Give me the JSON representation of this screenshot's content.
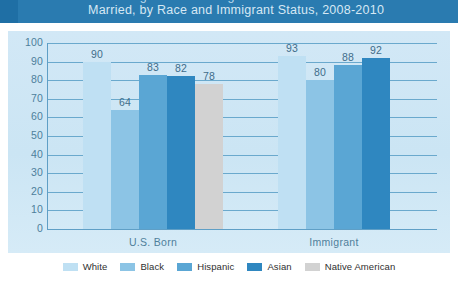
{
  "header": {
    "cut_title_line": "Percentage of Women Ages 18-44 Who Are",
    "subtitle": "Married, by Race and Immigrant Status, 2008-2010",
    "band_color": "#2a7bb0"
  },
  "chart_data": {
    "type": "bar",
    "title": "",
    "subtitle": "Married, by Race and Immigrant Status, 2008-2010",
    "xlabel": "",
    "ylabel": "",
    "ylim": [
      0,
      100
    ],
    "yticks": [
      100,
      90,
      80,
      70,
      60,
      50,
      40,
      30,
      20,
      10,
      0
    ],
    "grid": true,
    "legend_position": "bottom",
    "categories": [
      "U.S. Born",
      "Immigrant"
    ],
    "series": [
      {
        "name": "White",
        "color": "#bfe0f3",
        "values": [
          90,
          93
        ]
      },
      {
        "name": "Black",
        "color": "#8cc4e5",
        "values": [
          64,
          80
        ]
      },
      {
        "name": "Hispanic",
        "color": "#5aa6d4",
        "values": [
          83,
          88
        ]
      },
      {
        "name": "Asian",
        "color": "#2f87c0",
        "values": [
          82,
          92
        ]
      },
      {
        "name": "Native American",
        "color": "#d2d2d2",
        "values": [
          78,
          null
        ]
      }
    ],
    "data_labels": {
      "U.S. Born": [
        "90",
        "64",
        "83",
        "82",
        "78"
      ],
      "Immigrant": [
        "93",
        "80",
        "88",
        "92"
      ]
    }
  },
  "legend": {
    "items": [
      {
        "label": "White",
        "color": "#bfe0f3"
      },
      {
        "label": "Black",
        "color": "#8cc4e5"
      },
      {
        "label": "Hispanic",
        "color": "#5aa6d4"
      },
      {
        "label": "Asian",
        "color": "#2f87c0"
      },
      {
        "label": "Native American",
        "color": "#d2d2d2"
      }
    ]
  }
}
